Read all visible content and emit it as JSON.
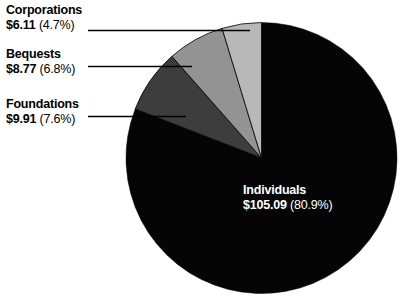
{
  "chart_data": {
    "type": "pie",
    "title": "",
    "subtitle": "",
    "xlabel": "",
    "ylabel": "",
    "legend_position": "none",
    "grid": false,
    "units": "billions of dollars",
    "total": 129.88,
    "start_angle_deg": 0,
    "direction": "clockwise",
    "categories": [
      "Individuals",
      "Corporations",
      "Bequests",
      "Foundations"
    ],
    "values": [
      105.09,
      6.11,
      8.77,
      9.91
    ],
    "percents": [
      80.9,
      4.7,
      6.8,
      7.6
    ],
    "colors": [
      "#050505",
      "#b8b8b8",
      "#939393",
      "#3d3d3d"
    ],
    "slices": [
      {
        "name": "Individuals",
        "label": "Individuals",
        "amount": "$105.09",
        "percent": "(80.9%)",
        "value": 105.09,
        "percent_value": 80.9,
        "color": "#050505",
        "label_placement": "inside",
        "label_color": "#ffffff"
      },
      {
        "name": "Corporations",
        "label": "Corporations",
        "amount": "$6.11",
        "percent": "(4.7%)",
        "value": 6.11,
        "percent_value": 4.7,
        "color": "#b8b8b8",
        "label_placement": "callout",
        "label_color": "#000000"
      },
      {
        "name": "Bequests",
        "label": "Bequests",
        "amount": "$8.77",
        "percent": "(6.8%)",
        "value": 8.77,
        "percent_value": 6.8,
        "color": "#939393",
        "label_placement": "callout",
        "label_color": "#000000"
      },
      {
        "name": "Foundations",
        "label": "Foundations",
        "amount": "$9.91",
        "percent": "(7.6%)",
        "value": 9.91,
        "percent_value": 7.6,
        "color": "#3d3d3d",
        "label_placement": "callout",
        "label_color": "#000000"
      }
    ]
  },
  "callouts": {
    "corporations": {
      "category": "Corporations",
      "amount": "$6.11",
      "percent": "(4.7%)"
    },
    "bequests": {
      "category": "Bequests",
      "amount": "$8.77",
      "percent": "(6.8%)"
    },
    "foundations": {
      "category": "Foundations",
      "amount": "$9.91",
      "percent": "(7.6%)"
    }
  },
  "inner_labels": {
    "individuals": {
      "category": "Individuals",
      "amount": "$105.09",
      "percent": "(80.9%)"
    }
  },
  "style": {
    "background": "#ffffff",
    "stroke": "#000000",
    "leader_line_color": "#000000"
  }
}
